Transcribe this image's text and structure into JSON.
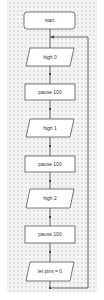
{
  "flowchart": {
    "nodes": [
      {
        "id": "start",
        "type": "terminal",
        "label": "start"
      },
      {
        "id": "high0",
        "type": "io",
        "label": "high 0"
      },
      {
        "id": "pause1",
        "type": "process",
        "label": "pause 100"
      },
      {
        "id": "high1",
        "type": "io",
        "label": "high 1"
      },
      {
        "id": "pause2",
        "type": "process",
        "label": "pause 100"
      },
      {
        "id": "high2",
        "type": "io",
        "label": "high 2"
      },
      {
        "id": "pause3",
        "type": "process",
        "label": "pause 100"
      },
      {
        "id": "letpins",
        "type": "io",
        "label": "let pins = 0"
      }
    ],
    "loop": {
      "from": "letpins",
      "to": "high0",
      "direction": "back-to-top"
    }
  },
  "colors": {
    "background": "#f4f4f4",
    "grid_dot": "#c9c9c9",
    "shape_fill": "#ffffff",
    "shape_stroke": "#555555",
    "connector": "#444444"
  }
}
